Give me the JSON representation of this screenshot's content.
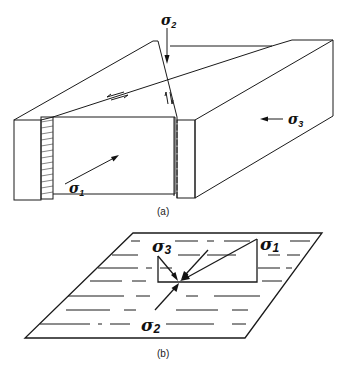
{
  "figure": {
    "top_partial_text": "sigma, and sigma_3 (a) is dip in sh",
    "panel_a": {
      "caption": "(a)",
      "labels": {
        "sigma1": {
          "symbol": "σ",
          "sub": "1"
        },
        "sigma2": {
          "symbol": "σ",
          "sub": "2"
        },
        "sigma3": {
          "symbol": "σ",
          "sub": "3"
        }
      },
      "description": "Block diagram of a strike-slip fault: block with vertical fault plane, sigma2 vertical arrow, sigma1 horizontal arrow into block, sigma3 horizontal arrow from side, shear arrows on fault traces"
    },
    "panel_b": {
      "caption": "(b)",
      "labels": {
        "sigma1": {
          "symbol": "σ",
          "sub": "1"
        },
        "sigma2": {
          "symbol": "σ",
          "sub": "2"
        },
        "sigma3": {
          "symbol": "σ",
          "sub": "3"
        }
      },
      "description": "Horizontal plane (parallelogram) with dashed bedding lines and stress vectors sigma1, sigma2, sigma3 converging at a point"
    }
  }
}
